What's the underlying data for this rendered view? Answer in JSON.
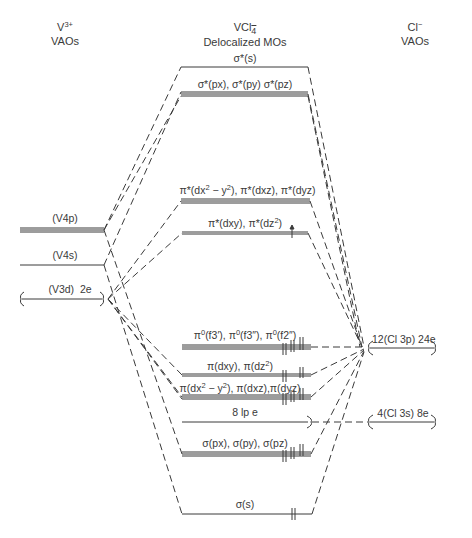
{
  "headers": {
    "left": {
      "line1": "V",
      "sup": "3+",
      "line2": "VAOs"
    },
    "center": {
      "line1": "VCl",
      "sub": "4",
      "sup": "−",
      "line2": "Delocalized MOs"
    },
    "right": {
      "line1": "Cl",
      "sup": "−",
      "line2": "VAOs"
    }
  },
  "left_levels": [
    {
      "id": "v4p",
      "label": "(V4p)",
      "y": 230,
      "lines": 3
    },
    {
      "id": "v4s",
      "label": "(V4s)",
      "y": 265,
      "lines": 1
    },
    {
      "id": "v3d",
      "label": "(V3d)  2e",
      "y": 299,
      "lines": 1,
      "brace": true
    }
  ],
  "mo_levels": [
    {
      "id": "sigma-star-s",
      "label": "σ*(s)",
      "y": 67,
      "lines": 1
    },
    {
      "id": "sigma-star-p",
      "label": "σ*(px), σ*(py) σ*(pz)",
      "y": 94,
      "lines": 3
    },
    {
      "id": "pi-star-dx2",
      "label": "π*(dx2 − y2), π*(dxz), π*(dyz)",
      "y": 201,
      "lines": 3
    },
    {
      "id": "pi-star-dxy",
      "label": "π*(dxy), π*(dz2)",
      "y": 233,
      "lines": 2,
      "electrons": "↿"
    },
    {
      "id": "pi0-f",
      "label": "π0(f3′), π0(f3″), π0(f2″)",
      "y": 347,
      "lines": 3,
      "electrons": "⇅⇅⇅"
    },
    {
      "id": "pi-dxy",
      "label": "π(dxy), π(dz2)",
      "y": 375,
      "lines": 2,
      "electrons": "⇅⇅"
    },
    {
      "id": "pi-dx2",
      "label": "π(dx2 − y2), π(dxz),π(dyz)",
      "y": 397,
      "lines": 3,
      "electrons": "⇅⇅⇅"
    },
    {
      "id": "lone-pairs",
      "label": "8 lp e",
      "y": 422,
      "lines": 1,
      "brace": true
    },
    {
      "id": "sigma-p",
      "label": "σ(px), σ(py), σ(pz)",
      "y": 454,
      "lines": 3,
      "electrons": "⇅⇅⇅"
    },
    {
      "id": "sigma-s",
      "label": "σ(s)",
      "y": 514,
      "lines": 1,
      "electrons": "⇅"
    }
  ],
  "right_levels": [
    {
      "id": "cl3p",
      "label": "12(Cl 3p) 24e",
      "y": 348
    },
    {
      "id": "cl3s",
      "label": "4(Cl 3s) 8e",
      "y": 422
    }
  ],
  "labels": {
    "v4p": "(V4p)",
    "v4s": "(V4s)",
    "v3d": "(V3d)  2e",
    "sigma_star_s": "σ*(s)",
    "sigma_star_p": "σ*(px), σ*(py) σ*(pz)",
    "pi_star_dx2_a": "π*(dx",
    "pi_star_dx2_b": " − y",
    "pi_star_dx2_c": "), π*(dxz), π*(dyz)",
    "pi_star_dxy_a": "π*(dxy), π*(dz",
    "pi_star_dxy_b": ")",
    "pi0_a": "π",
    "pi0_b": "(f3′), π",
    "pi0_c": "(f3″), π",
    "pi0_d": "(f2″)",
    "pi_dxy_a": "π(dxy), π(dz",
    "pi_dxy_b": ")",
    "pi_dx2_a": "π(dx",
    "pi_dx2_b": " − y",
    "pi_dx2_c": "), π(dxz),π(dyz)",
    "lone_pairs": "8 lp e",
    "sigma_p": "σ(px), σ(py), σ(pz)",
    "sigma_s": "σ(s)",
    "cl3p": "12(Cl 3p) 24e",
    "cl3s": "4(Cl 3s) 8e",
    "sup2": "2",
    "sup0": "0"
  }
}
